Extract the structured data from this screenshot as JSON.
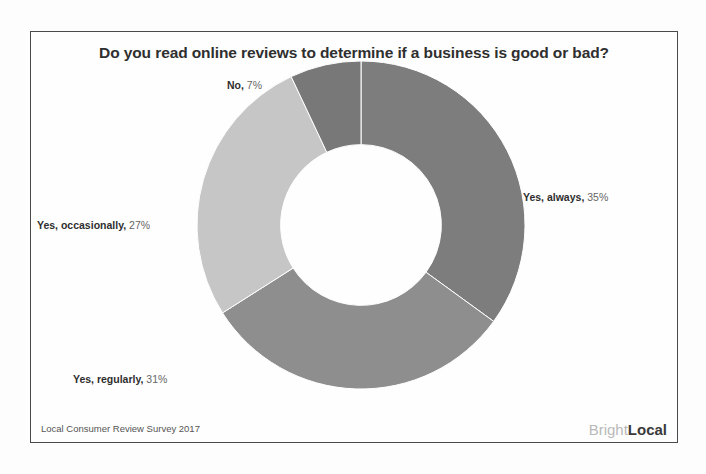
{
  "chart_data": {
    "type": "pie",
    "variant": "donut",
    "title": "Do you read online reviews to determine if a business is good or bad?",
    "categories": [
      "Yes, always",
      "Yes, regularly",
      "Yes, occasionally",
      "No"
    ],
    "values": [
      35,
      31,
      27,
      7
    ],
    "value_suffix": "%",
    "colors": [
      "#7d7d7d",
      "#8e8e8e",
      "#c6c6c6",
      "#787878"
    ],
    "start_angle_deg": 0,
    "direction": "clockwise",
    "inner_radius_ratio": 0.49,
    "legend": "none",
    "labels": [
      {
        "category": "No",
        "value": "7%",
        "text": "No, 7%"
      },
      {
        "category": "Yes, always",
        "value": "35%",
        "text": "Yes, always, 35%"
      },
      {
        "category": "Yes, occasionally",
        "value": "27%",
        "text": "Yes, occasionally, 27%"
      },
      {
        "category": "Yes, regularly",
        "value": "31%",
        "text": "Yes, regularly, 31%"
      }
    ],
    "xlabel": "",
    "ylabel": ""
  },
  "footer": {
    "source": "Local Consumer Review Survey 2017"
  },
  "brand": {
    "part_light": "Bright",
    "part_bold": "Local"
  }
}
